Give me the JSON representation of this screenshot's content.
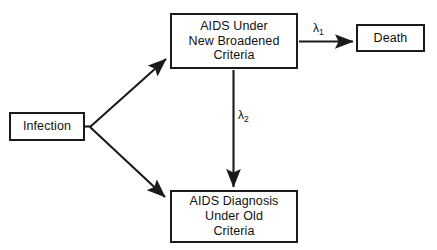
{
  "diagram": {
    "background_color": "#ffffff",
    "stroke_color": "#1a1a1a",
    "text_color": "#111111",
    "nodes": [
      {
        "id": "infection",
        "label": "Infection",
        "shape": "rectangle"
      },
      {
        "id": "aids_new_criteria",
        "label": "AIDS Under\nNew Broadened\nCriteria",
        "shape": "rectangle"
      },
      {
        "id": "death",
        "label": "Death",
        "shape": "rectangle"
      },
      {
        "id": "aids_old_criteria",
        "label": "AIDS Diagnosis\nUnder Old\nCriteria",
        "shape": "rectangle"
      }
    ],
    "edges": [
      {
        "id": "infection_to_aids_new",
        "from": "infection",
        "to": "aids_new_criteria",
        "label": "",
        "style": "solid-arrow",
        "direction": "diagonal-up-right"
      },
      {
        "id": "infection_to_aids_old",
        "from": "infection",
        "to": "aids_old_criteria",
        "label": "",
        "style": "solid-arrow",
        "direction": "diagonal-down-right"
      },
      {
        "id": "aids_new_to_death",
        "from": "aids_new_criteria",
        "to": "death",
        "label": "λ",
        "label_subscript": "1",
        "style": "solid-arrow",
        "direction": "right"
      },
      {
        "id": "aids_new_to_aids_old",
        "from": "aids_new_criteria",
        "to": "aids_old_criteria",
        "label": "λ",
        "label_subscript": "2",
        "style": "solid-arrow",
        "direction": "down"
      }
    ],
    "labels": {
      "lambda1_symbol": "λ",
      "lambda1_subscript": "1",
      "lambda2_symbol": "λ",
      "lambda2_subscript": "2"
    }
  }
}
